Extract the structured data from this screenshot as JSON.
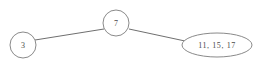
{
  "diagram": {
    "type": "tree-graph",
    "background_color": "#ffffff",
    "stroke_color": "#8a8a8a",
    "edge_color": "#6f6f6f",
    "text_color": "#4a4a4a",
    "nodes": [
      {
        "id": "root",
        "shape": "circle",
        "label": "7",
        "cx": 116,
        "cy": 23,
        "r": 13
      },
      {
        "id": "left-leaf",
        "shape": "circle",
        "label": "3",
        "cx": 23,
        "cy": 45,
        "r": 13
      },
      {
        "id": "right-leaf",
        "shape": "ellipse",
        "label": "11,  15,  17",
        "cx": 217,
        "cy": 45,
        "rx": 35,
        "ry": 12
      }
    ],
    "edges": [
      {
        "id": "edge-root-left",
        "from": "root",
        "to": "left-leaf",
        "x1": 104,
        "y1": 29,
        "x2": 35,
        "y2": 40
      },
      {
        "id": "edge-root-right",
        "from": "root",
        "to": "right-leaf",
        "x1": 129,
        "y1": 29,
        "x2": 185,
        "y2": 41
      }
    ]
  }
}
